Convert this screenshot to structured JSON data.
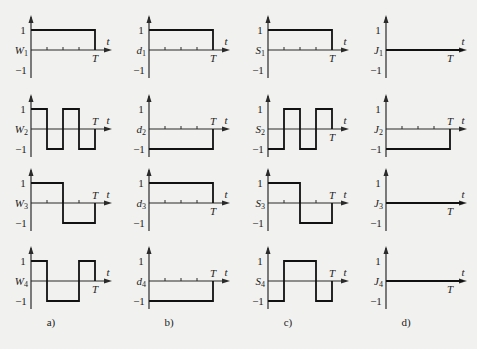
{
  "figure": {
    "columns": [
      {
        "id": "a",
        "caption": "a)",
        "symbol": "W",
        "axis_x": 31
      },
      {
        "id": "b",
        "caption": "b)",
        "symbol": "d",
        "axis_x": 149
      },
      {
        "id": "c",
        "caption": "c)",
        "symbol": "S",
        "axis_x": 268
      },
      {
        "id": "d",
        "caption": "d)",
        "symbol": "J",
        "axis_x": 386
      }
    ],
    "rows": [
      {
        "index": 1,
        "zero_y": 50
      },
      {
        "index": 2,
        "zero_y": 129
      },
      {
        "index": 3,
        "zero_y": 203
      },
      {
        "index": 4,
        "zero_y": 281
      }
    ],
    "axis_labels": {
      "time": "t",
      "period": "T",
      "plus_one": "1",
      "minus_one": "−1"
    },
    "caption_y": 326
  },
  "chart_data": {
    "type": "line",
    "title": "",
    "xlabel": "t",
    "ylabel": "",
    "ylim": [
      -1,
      1
    ],
    "x_range": [
      0,
      1
    ],
    "note": "Each waveform defined as piecewise-constant levels over 4 equal segments of [0,T]",
    "panels": [
      {
        "caption": "a)",
        "series": [
          {
            "name": "W1",
            "segments": [
              1,
              1,
              1,
              1
            ],
            "tick_marks": true
          },
          {
            "name": "W2",
            "segments": [
              1,
              -1,
              1,
              -1
            ],
            "tick_marks": false
          },
          {
            "name": "W3",
            "segments": [
              1,
              1,
              -1,
              -1
            ],
            "tick_marks": true
          },
          {
            "name": "W4",
            "segments": [
              1,
              -1,
              -1,
              1
            ],
            "tick_marks": false
          }
        ]
      },
      {
        "caption": "b)",
        "series": [
          {
            "name": "d1",
            "segments": [
              1,
              1,
              1,
              1
            ],
            "tick_marks": true
          },
          {
            "name": "d2",
            "segments": [
              -1,
              -1,
              -1,
              -1
            ],
            "tick_marks": true
          },
          {
            "name": "d3",
            "segments": [
              1,
              1,
              1,
              1
            ],
            "tick_marks": true
          },
          {
            "name": "d4",
            "segments": [
              -1,
              -1,
              -1,
              -1
            ],
            "tick_marks": true
          }
        ]
      },
      {
        "caption": "c)",
        "series": [
          {
            "name": "S1",
            "segments": [
              1,
              1,
              1,
              1
            ],
            "tick_marks": true
          },
          {
            "name": "S2",
            "segments": [
              -1,
              1,
              -1,
              1
            ],
            "tick_marks": false
          },
          {
            "name": "S3",
            "segments": [
              1,
              1,
              -1,
              -1
            ],
            "tick_marks": true
          },
          {
            "name": "S4",
            "segments": [
              -1,
              1,
              1,
              -1
            ],
            "tick_marks": false
          }
        ]
      },
      {
        "caption": "d)",
        "series": [
          {
            "name": "J1",
            "segments": [
              0,
              0,
              0,
              0
            ],
            "tick_marks": false
          },
          {
            "name": "J2",
            "segments": [
              -1,
              -1,
              -1,
              -1
            ],
            "tick_marks": true
          },
          {
            "name": "J3",
            "segments": [
              0,
              0,
              0,
              0
            ],
            "tick_marks": false
          },
          {
            "name": "J4",
            "segments": [
              0,
              0,
              0,
              0
            ],
            "tick_marks": false
          }
        ]
      }
    ]
  }
}
